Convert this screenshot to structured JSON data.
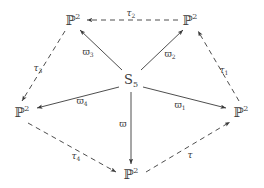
{
  "diagram": {
    "type": "commutative-diagram",
    "center_node": {
      "id": "S5",
      "base": "S",
      "subscript": "5",
      "x": 131,
      "y": 79
    },
    "outer_nodes": [
      {
        "id": "p2-top-left",
        "base": "ℙ",
        "superscript": "2",
        "x": 73,
        "y": 20
      },
      {
        "id": "p2-top-right",
        "base": "ℙ",
        "superscript": "2",
        "x": 190,
        "y": 20
      },
      {
        "id": "p2-right",
        "base": "ℙ",
        "superscript": "2",
        "x": 241,
        "y": 112
      },
      {
        "id": "p2-bottom",
        "base": "ℙ",
        "superscript": "2",
        "x": 131,
        "y": 174
      },
      {
        "id": "p2-left",
        "base": "ℙ",
        "superscript": "2",
        "x": 22,
        "y": 112
      }
    ],
    "solid_edges": [
      {
        "id": "edge-varpi3",
        "from": "S5",
        "to": "p2-top-left",
        "label_base": "ϖ",
        "label_sub": "3",
        "label_x": 88,
        "label_y": 52
      },
      {
        "id": "edge-varpi2",
        "from": "S5",
        "to": "p2-top-right",
        "label_base": "ϖ",
        "label_sub": "2",
        "label_x": 170,
        "label_y": 54
      },
      {
        "id": "edge-varpi1",
        "from": "S5",
        "to": "p2-right",
        "label_base": "ϖ",
        "label_sub": "1",
        "label_x": 180,
        "label_y": 105
      },
      {
        "id": "edge-varpi",
        "from": "S5",
        "to": "p2-bottom",
        "label_base": "ϖ",
        "label_sub": "",
        "label_x": 123,
        "label_y": 124
      },
      {
        "id": "edge-varpi4",
        "from": "S5",
        "to": "p2-left",
        "label_base": "ϖ",
        "label_sub": "4",
        "label_x": 82,
        "label_y": 101
      }
    ],
    "dashed_edges": [
      {
        "id": "edge-tau2",
        "from": "p2-top-right",
        "to": "p2-top-left",
        "label_base": "τ",
        "label_sub": "2",
        "label_x": 131,
        "label_y": 13
      },
      {
        "id": "edge-tau1",
        "from": "p2-right",
        "to": "p2-top-right",
        "label_base": "τ",
        "label_sub": "1",
        "label_x": 224,
        "label_y": 70
      },
      {
        "id": "edge-tau",
        "from": "p2-bottom",
        "to": "p2-right",
        "label_base": "τ",
        "label_sub": "",
        "label_x": 190,
        "label_y": 155
      },
      {
        "id": "edge-tau4",
        "from": "p2-left",
        "to": "p2-bottom",
        "label_base": "τ",
        "label_sub": "4",
        "label_x": 76,
        "label_y": 156
      },
      {
        "id": "edge-tau3",
        "from": "p2-top-left",
        "to": "p2-left",
        "label_base": "τ",
        "label_sub": "3",
        "label_x": 38,
        "label_y": 68
      }
    ],
    "colors": {
      "stroke": "#3a3a3a",
      "text": "#3a3a3a",
      "background": "#ffffff"
    }
  }
}
